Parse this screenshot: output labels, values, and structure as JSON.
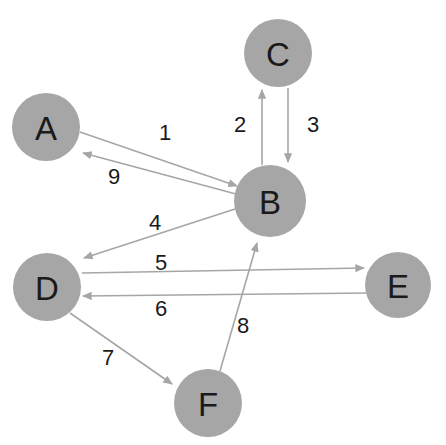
{
  "diagram": {
    "background_color": "#ffffff",
    "node_color": "#a6a6a6",
    "edge_color": "#a6a6a6",
    "label_color": "#1a1a1a"
  },
  "nodes": [
    {
      "id": "A",
      "label": "A",
      "cx": 46,
      "cy": 127,
      "r": 34
    },
    {
      "id": "B",
      "label": "B",
      "cx": 270,
      "cy": 201,
      "r": 36
    },
    {
      "id": "C",
      "label": "C",
      "cx": 278,
      "cy": 53,
      "r": 34
    },
    {
      "id": "D",
      "label": "D",
      "cx": 47,
      "cy": 287,
      "r": 34
    },
    {
      "id": "E",
      "label": "E",
      "cx": 398,
      "cy": 285,
      "r": 33
    },
    {
      "id": "F",
      "label": "F",
      "cx": 208,
      "cy": 403,
      "r": 34
    }
  ],
  "edges": [
    {
      "id": "e1",
      "label": "1",
      "from": "A",
      "to": "B",
      "x1": 80,
      "y1": 132,
      "x2": 237,
      "y2": 186,
      "label_x": 165,
      "label_y": 132
    },
    {
      "id": "e2",
      "label": "2",
      "from": "B",
      "to": "C",
      "x1": 262,
      "y1": 165,
      "x2": 262,
      "y2": 90,
      "label_x": 240,
      "label_y": 124
    },
    {
      "id": "e3",
      "label": "3",
      "from": "C",
      "to": "B",
      "x1": 288,
      "y1": 88,
      "x2": 288,
      "y2": 162,
      "label_x": 313,
      "label_y": 124
    },
    {
      "id": "e4",
      "label": "4",
      "from": "B",
      "to": "D",
      "x1": 235,
      "y1": 209,
      "x2": 84,
      "y2": 258,
      "label_x": 155,
      "label_y": 222
    },
    {
      "id": "e5",
      "label": "5",
      "from": "D",
      "to": "E",
      "x1": 82,
      "y1": 273,
      "x2": 364,
      "y2": 268,
      "label_x": 161,
      "label_y": 262
    },
    {
      "id": "e6",
      "label": "6",
      "from": "E",
      "to": "D",
      "x1": 368,
      "y1": 293,
      "x2": 83,
      "y2": 296,
      "label_x": 161,
      "label_y": 308
    },
    {
      "id": "e7",
      "label": "7",
      "from": "D",
      "to": "F",
      "x1": 70,
      "y1": 313,
      "x2": 172,
      "y2": 384,
      "label_x": 108,
      "label_y": 357
    },
    {
      "id": "e8",
      "label": "8",
      "from": "F",
      "to": "B",
      "x1": 220,
      "y1": 371,
      "x2": 257,
      "y2": 243,
      "label_x": 243,
      "label_y": 325
    },
    {
      "id": "e9",
      "label": "9",
      "from": "B",
      "to": "A",
      "x1": 236,
      "y1": 194,
      "x2": 83,
      "y2": 153,
      "label_x": 114,
      "label_y": 176
    }
  ]
}
